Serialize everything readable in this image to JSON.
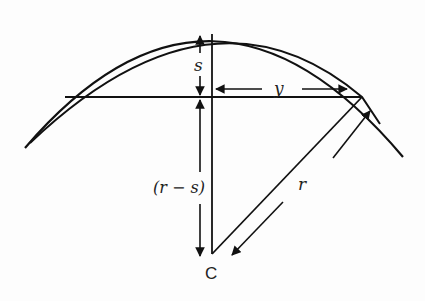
{
  "diagram": {
    "labels": {
      "sagitta": "s",
      "half_chord": "y",
      "radius_minus_sagitta": "(r − s)",
      "radius": "r",
      "center": "C"
    },
    "colors": {
      "stroke": "#111111",
      "background": "#fdfdfd"
    }
  }
}
